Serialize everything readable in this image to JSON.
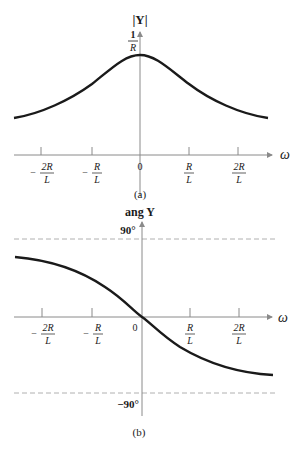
{
  "figure_a": {
    "y_label": "|Y|",
    "peak_label_num": "1",
    "peak_label_den": "R",
    "x_label": "ω",
    "caption": "(a)",
    "ticks": [
      {
        "sign": "−",
        "num": "2R",
        "den": "L"
      },
      {
        "sign": "−",
        "num": "R",
        "den": "L"
      },
      {
        "sign": "",
        "num": "0",
        "den": ""
      },
      {
        "sign": "",
        "num": "R",
        "den": "L"
      },
      {
        "sign": "",
        "num": "2R",
        "den": "L"
      }
    ]
  },
  "figure_b": {
    "y_label": "ang Y",
    "upper_asymptote": "90°",
    "lower_asymptote": "−90°",
    "x_label": "ω",
    "origin_label": "0",
    "caption": "(b)",
    "ticks": [
      {
        "sign": "−",
        "num": "2R",
        "den": "L"
      },
      {
        "sign": "−",
        "num": "R",
        "den": "L"
      },
      {
        "sign": "",
        "num": "R",
        "den": "L"
      },
      {
        "sign": "",
        "num": "2R",
        "den": "L"
      }
    ]
  },
  "colors": {
    "curve": "#1a1a1a",
    "axis": "#8a8a8a",
    "dashed": "#b0b0b0"
  }
}
